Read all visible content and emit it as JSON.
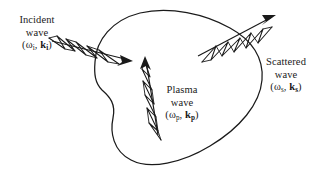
{
  "figure": {
    "type": "diagram",
    "background_color": "#ffffff",
    "stroke_color": "#1a1a1a"
  },
  "labels": {
    "incident": {
      "line1": "Incident",
      "line2": "wave",
      "open_paren": "(",
      "omega": "ω",
      "omega_sub": "i",
      "comma": ", ",
      "k": "k",
      "k_sub": "i",
      "close_paren": ")"
    },
    "scattered": {
      "line1": "Scattered",
      "line2": "wave",
      "open_paren": "(",
      "omega": "ω",
      "omega_sub": "s",
      "comma": ", ",
      "k": "k",
      "k_sub": "s",
      "close_paren": ")"
    },
    "plasma": {
      "line1": "Plasma",
      "line2": "wave",
      "open_paren": "(",
      "omega": "ω",
      "omega_sub": "p",
      "comma": ", ",
      "k": "k",
      "k_sub": "p",
      "close_paren": ")"
    }
  },
  "elements": {
    "plasma_blob_name": "plasma-region-blob",
    "incident_arrow_name": "incident-wave-arrow",
    "scattered_arrow_name": "scattered-wave-arrow",
    "plasma_arrow_name": "plasma-wave-arrow"
  }
}
